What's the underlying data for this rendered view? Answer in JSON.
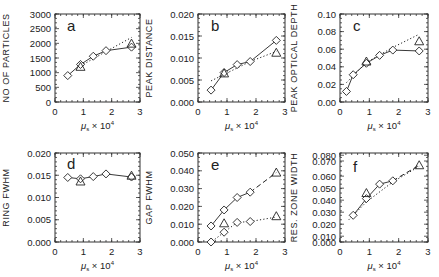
{
  "chart_data": [
    {
      "type": "line",
      "panel": "a",
      "ylabel": "NO OF PARTICLES",
      "xlabel": "μ_s × 10^4",
      "xlim": [
        0,
        3
      ],
      "ylim": [
        0,
        3000
      ],
      "xticks": [
        "0",
        "1",
        "2",
        "3"
      ],
      "yticks": [
        {
          "value": 0,
          "label": "0"
        },
        {
          "value": 500,
          "label": "500"
        },
        {
          "value": 1000,
          "label": "1000"
        },
        {
          "value": 1500,
          "label": "1500"
        },
        {
          "value": 2000,
          "label": "2000"
        },
        {
          "value": 2500,
          "label": "2500"
        },
        {
          "value": 3000,
          "label": "3000"
        }
      ],
      "series": [
        {
          "name": "diamonds",
          "marker": "diamond",
          "line": "solid",
          "x": [
            0.45,
            0.9,
            1.35,
            1.8,
            2.7
          ],
          "y": [
            900,
            1280,
            1560,
            1750,
            1870
          ]
        },
        {
          "name": "triangles",
          "marker": "triangle",
          "line": "none",
          "x": [
            0.9,
            2.7
          ],
          "y": [
            1200,
            1990
          ]
        },
        {
          "name": "fit",
          "marker": "none",
          "line": "dotted",
          "x": [
            0.9,
            1.8,
            2.7
          ],
          "y": [
            1230,
            1720,
            2200
          ]
        }
      ]
    },
    {
      "type": "line",
      "panel": "b",
      "ylabel": "PEAK DISTANCE",
      "xlabel": "μ_s × 10^4",
      "xlim": [
        0,
        3
      ],
      "ylim": [
        0,
        0.02
      ],
      "xticks": [
        "0",
        "1",
        "2",
        "3"
      ],
      "yticks": [
        {
          "value": 0.0,
          "label": "0.000"
        },
        {
          "value": 0.005,
          "label": "0.005"
        },
        {
          "value": 0.01,
          "label": "0.010"
        },
        {
          "value": 0.015,
          "label": "0.015"
        },
        {
          "value": 0.02,
          "label": "0.020"
        }
      ],
      "series": [
        {
          "name": "diamonds",
          "marker": "diamond",
          "line": "solid",
          "x": [
            0.45,
            0.9,
            1.35,
            1.8,
            2.7
          ],
          "y": [
            0.0027,
            0.0067,
            0.0085,
            0.0092,
            0.014
          ]
        },
        {
          "name": "triangles",
          "marker": "triangle",
          "line": "none",
          "x": [
            0.9,
            2.7
          ],
          "y": [
            0.0065,
            0.0112
          ]
        },
        {
          "name": "fit",
          "marker": "none",
          "line": "dotted",
          "x": [
            0.45,
            1.8,
            2.7
          ],
          "y": [
            0.0048,
            0.0092,
            0.0115
          ]
        }
      ]
    },
    {
      "type": "line",
      "panel": "c",
      "ylabel": "PEAK OPTICAL DEPTH",
      "xlabel": "μ_s × 10^4",
      "xlim": [
        0,
        3
      ],
      "ylim": [
        0,
        0.1
      ],
      "xticks": [
        "0",
        "1",
        "2",
        "3"
      ],
      "yticks": [
        {
          "value": 0.0,
          "label": "0.00"
        },
        {
          "value": 0.02,
          "label": "0.02"
        },
        {
          "value": 0.04,
          "label": "0.04"
        },
        {
          "value": 0.06,
          "label": "0.06"
        },
        {
          "value": 0.08,
          "label": "0.08"
        },
        {
          "value": 0.1,
          "label": "0.10"
        }
      ],
      "series": [
        {
          "name": "diamonds",
          "marker": "diamond",
          "line": "solid",
          "x": [
            0.22,
            0.45,
            0.9,
            1.35,
            1.8,
            2.7
          ],
          "y": [
            0.012,
            0.031,
            0.044,
            0.053,
            0.059,
            0.058
          ]
        },
        {
          "name": "triangles",
          "marker": "triangle",
          "line": "none",
          "x": [
            0.9,
            2.7
          ],
          "y": [
            0.046,
            0.069
          ]
        },
        {
          "name": "fit",
          "marker": "none",
          "line": "dotted",
          "x": [
            0.22,
            0.9,
            1.8,
            2.7
          ],
          "y": [
            0.022,
            0.045,
            0.062,
            0.077
          ]
        }
      ]
    },
    {
      "type": "line",
      "panel": "d",
      "ylabel": "RING FWHM",
      "xlabel": "μ_s × 10^4",
      "xlim": [
        0,
        3
      ],
      "ylim": [
        0,
        0.02
      ],
      "xticks": [
        "0",
        "1",
        "2",
        "3"
      ],
      "yticks": [
        {
          "value": 0.0,
          "label": "0.000"
        },
        {
          "value": 0.005,
          "label": "0.005"
        },
        {
          "value": 0.01,
          "label": "0.010"
        },
        {
          "value": 0.015,
          "label": "0.015"
        },
        {
          "value": 0.02,
          "label": "0.020"
        }
      ],
      "series": [
        {
          "name": "diamonds",
          "marker": "diamond",
          "line": "solid",
          "x": [
            0.45,
            0.9,
            1.35,
            1.8,
            2.7
          ],
          "y": [
            0.0145,
            0.0142,
            0.0147,
            0.0153,
            0.0146
          ]
        },
        {
          "name": "triangles",
          "marker": "triangle",
          "line": "none",
          "x": [
            0.9,
            2.7
          ],
          "y": [
            0.0136,
            0.0149
          ]
        }
      ]
    },
    {
      "type": "line",
      "panel": "e",
      "ylabel": "GAP FWHM",
      "xlabel": "μ_s × 10^4",
      "xlim": [
        0,
        3
      ],
      "ylim": [
        0,
        0.05
      ],
      "xticks": [
        "0",
        "1",
        "2",
        "3"
      ],
      "yticks": [
        {
          "value": 0.0,
          "label": "0.000"
        },
        {
          "value": 0.01,
          "label": "0.010"
        },
        {
          "value": 0.02,
          "label": "0.020"
        },
        {
          "value": 0.03,
          "label": "0.030"
        },
        {
          "value": 0.04,
          "label": "0.040"
        },
        {
          "value": 0.05,
          "label": "0.050"
        }
      ],
      "series": [
        {
          "name": "upper-diamonds",
          "marker": "diamond",
          "line": "solid",
          "x": [
            0.45,
            0.9,
            1.35,
            1.8
          ],
          "y": [
            0.009,
            0.018,
            0.025,
            0.028
          ]
        },
        {
          "name": "upper-fit",
          "marker": "none",
          "line": "dashed",
          "x": [
            1.8,
            2.7
          ],
          "y": [
            0.028,
            0.039
          ]
        },
        {
          "name": "lower-diamonds",
          "marker": "diamond",
          "line": "none",
          "x": [
            0.45,
            0.9,
            1.35,
            1.8
          ],
          "y": [
            0.0,
            0.0055,
            0.011,
            0.0115
          ]
        },
        {
          "name": "lower-fit",
          "marker": "none",
          "line": "dotted",
          "x": [
            0.3,
            0.9,
            1.35,
            1.8,
            2.7
          ],
          "y": [
            -0.002,
            0.0055,
            0.011,
            0.0115,
            0.014
          ]
        },
        {
          "name": "triangles",
          "marker": "triangle",
          "line": "none",
          "x": [
            0.9,
            2.7,
            2.7
          ],
          "y": [
            0.0105,
            0.039,
            0.0145
          ]
        }
      ]
    },
    {
      "type": "line",
      "panel": "f",
      "ylabel": "RES. ZONE WIDTH",
      "xlabel": "μ_s × 10^4",
      "xlim": [
        0,
        3
      ],
      "ylim": [
        0,
        0.08
      ],
      "xticks": [
        "0",
        "1",
        "2",
        "3"
      ],
      "yticks": [
        {
          "value": 0.0,
          "label": "0.000",
          "frac": 0.0
        },
        {
          "value": 0.01,
          "label": "0.010",
          "frac": 0.065
        },
        {
          "value": 0.02,
          "label": "0.020",
          "frac": 0.2
        },
        {
          "value": 0.03,
          "label": "0.030",
          "frac": 0.335
        },
        {
          "value": 0.04,
          "label": "0.040",
          "frac": 0.47
        },
        {
          "value": 0.05,
          "label": "0.050",
          "frac": 0.605
        },
        {
          "value": 0.06,
          "label": "0.060",
          "frac": 0.74
        },
        {
          "value": 0.07,
          "label": "0.070",
          "frac": 0.91
        },
        {
          "value": 0.08,
          "label": "0.080",
          "frac": 0.975
        }
      ],
      "series": [
        {
          "name": "diamonds",
          "marker": "diamond",
          "line": "solid",
          "x": [
            0.45,
            0.9,
            1.35,
            1.8
          ],
          "y": [
            0.024,
            0.039,
            0.052,
            0.055
          ]
        },
        {
          "name": "triangles",
          "marker": "triangle",
          "line": "none",
          "x": [
            0.9,
            2.7
          ],
          "y": [
            0.044,
            0.069
          ]
        },
        {
          "name": "fit",
          "marker": "none",
          "line": "dotted",
          "x": [
            0.3,
            0.9,
            1.8,
            2.7
          ],
          "y": [
            0.02,
            0.036,
            0.054,
            0.068
          ]
        },
        {
          "name": "fit2",
          "marker": "none",
          "line": "dashed",
          "x": [
            1.8,
            2.7
          ],
          "y": [
            0.055,
            0.069
          ]
        }
      ]
    }
  ]
}
